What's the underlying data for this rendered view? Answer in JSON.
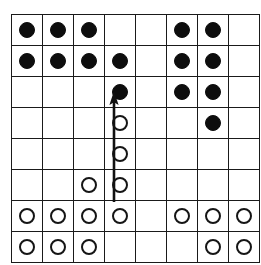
{
  "diagram": {
    "board": {
      "rows": 8,
      "columns": 8,
      "cell_size_px": 30,
      "line_color": "#1a1a1a",
      "background_color": "#ffffff"
    },
    "stone_colors": {
      "black": "#0d0d0d",
      "white_fill": "#ffffff",
      "white_outline": "#151515"
    },
    "legend": {
      "black_label": "black stone",
      "white_label": "white stone"
    },
    "cells": [
      [
        "black",
        "black",
        "black",
        "empty",
        "empty",
        "black",
        "black",
        "empty"
      ],
      [
        "black",
        "black",
        "black",
        "black",
        "empty",
        "black",
        "black",
        "empty"
      ],
      [
        "empty",
        "empty",
        "empty",
        "black",
        "empty",
        "black",
        "black",
        "empty"
      ],
      [
        "empty",
        "empty",
        "empty",
        "white",
        "empty",
        "empty",
        "black",
        "empty"
      ],
      [
        "empty",
        "empty",
        "empty",
        "white",
        "empty",
        "empty",
        "empty",
        "empty"
      ],
      [
        "empty",
        "empty",
        "white",
        "white",
        "empty",
        "empty",
        "empty",
        "empty"
      ],
      [
        "white",
        "white",
        "white",
        "white",
        "empty",
        "white",
        "white",
        "white"
      ],
      [
        "white",
        "white",
        "white",
        "empty",
        "empty",
        "empty",
        "white",
        "white"
      ]
    ],
    "arrow": {
      "name": "move-direction-arrow",
      "direction": "up",
      "color": "#111111",
      "from_column": 4,
      "from_row": 7,
      "to_column": 4,
      "to_row": 4,
      "x_px": 114,
      "tail_y_px": 202,
      "head_y_px": 91
    }
  }
}
